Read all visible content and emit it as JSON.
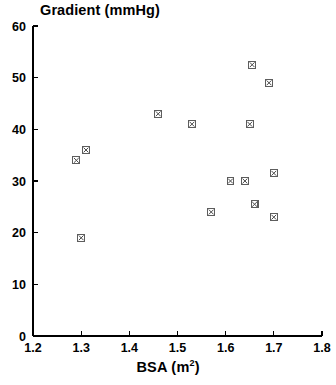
{
  "chart_data": {
    "type": "scatter",
    "title": "Gradient (mmHg)",
    "xlabel_text": "BSA (m",
    "xlabel_sup": "2",
    "xlabel_close": ")",
    "xlabel": "BSA (m2)",
    "ylabel": "Gradient (mmHg)",
    "xlim": [
      1.2,
      1.8
    ],
    "ylim": [
      0,
      60
    ],
    "xticks": [
      "1.2",
      "1.3",
      "1.4",
      "1.5",
      "1.6",
      "1.7",
      "1.8"
    ],
    "xtick_values": [
      1.2,
      1.3,
      1.4,
      1.5,
      1.6,
      1.7,
      1.8
    ],
    "yticks": [
      "0",
      "10",
      "20",
      "30",
      "40",
      "50",
      "60"
    ],
    "ytick_values": [
      0,
      10,
      20,
      30,
      40,
      50,
      60
    ],
    "grid": false,
    "legend": null,
    "marker": "square-with-x",
    "marker_color": "#555555",
    "points": [
      {
        "x": 1.29,
        "y": 34
      },
      {
        "x": 1.31,
        "y": 36
      },
      {
        "x": 1.3,
        "y": 19
      },
      {
        "x": 1.46,
        "y": 43
      },
      {
        "x": 1.53,
        "y": 41
      },
      {
        "x": 1.57,
        "y": 24
      },
      {
        "x": 1.61,
        "y": 30
      },
      {
        "x": 1.64,
        "y": 30
      },
      {
        "x": 1.65,
        "y": 41
      },
      {
        "x": 1.655,
        "y": 52.5
      },
      {
        "x": 1.66,
        "y": 25.5
      },
      {
        "x": 1.69,
        "y": 49
      },
      {
        "x": 1.7,
        "y": 31.5
      },
      {
        "x": 1.7,
        "y": 23
      }
    ]
  },
  "axes": {
    "x_pixel_left": 33,
    "x_pixel_right": 322,
    "y_pixel_top": 26,
    "y_pixel_bottom": 336
  }
}
